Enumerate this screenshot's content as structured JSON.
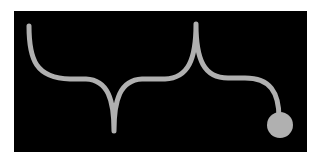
{
  "diagram": {
    "background_color": "#000000",
    "page_color": "#ffffff",
    "stroke_color": "#b0b0b0",
    "stroke_width": 5,
    "elements": [
      {
        "type": "curve",
        "name": "brace-line"
      },
      {
        "type": "cusp",
        "direction": "down",
        "x": 114,
        "y": 131
      },
      {
        "type": "cusp",
        "direction": "up",
        "x": 196,
        "y": 24
      },
      {
        "type": "end-dot",
        "cx": 280,
        "cy": 125,
        "r": 13
      }
    ]
  }
}
